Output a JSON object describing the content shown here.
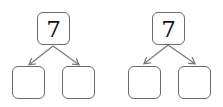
{
  "diagrams": [
    {
      "top_value": "7",
      "children": [
        "",
        ""
      ]
    },
    {
      "top_value": "7",
      "children": [
        "",
        ""
      ]
    }
  ],
  "colors": {
    "border": "#6b6b6b",
    "arrow": "#7a7a7a",
    "text": "#111111"
  }
}
